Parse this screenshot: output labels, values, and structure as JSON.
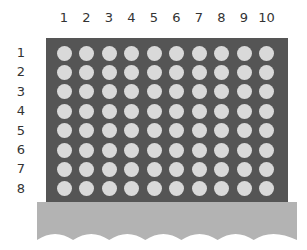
{
  "grid": {
    "columns": [
      "1",
      "2",
      "3",
      "4",
      "5",
      "6",
      "7",
      "8",
      "9",
      "10"
    ],
    "rows": [
      "1",
      "2",
      "3",
      "4",
      "5",
      "6",
      "7",
      "8"
    ],
    "board_color": "#555555",
    "dot_color": "#d9d9d9",
    "base_color": "#b3b3b3"
  }
}
